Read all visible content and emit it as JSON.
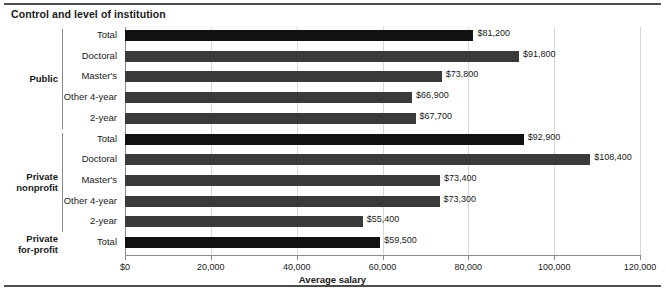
{
  "chart_data": {
    "type": "bar",
    "orientation": "horizontal",
    "title": "Control and level of institution",
    "xlabel": "Average salary",
    "ylabel": "",
    "xlim": [
      0,
      120000
    ],
    "grid": true,
    "legend": null,
    "xticks": [
      {
        "value": 0,
        "label": "$0"
      },
      {
        "value": 20000,
        "label": "20,000"
      },
      {
        "value": 40000,
        "label": "40,000"
      },
      {
        "value": 60000,
        "label": "60,000"
      },
      {
        "value": 80000,
        "label": "80,000"
      },
      {
        "value": 100000,
        "label": "100,000"
      },
      {
        "value": 120000,
        "label": "120,000"
      }
    ],
    "groups": [
      {
        "label": "Public",
        "label_lines": [
          "Public"
        ],
        "rows": [
          0,
          1,
          2,
          3,
          4
        ]
      },
      {
        "label": "Private nonprofit",
        "label_lines": [
          "Private",
          "nonprofit"
        ],
        "rows": [
          5,
          6,
          7,
          8,
          9
        ]
      },
      {
        "label": "Private for-profit",
        "label_lines": [
          "Private",
          "for-profit"
        ],
        "rows": [
          10
        ]
      }
    ],
    "categories": [
      "Total",
      "Doctoral",
      "Master's",
      "Other 4-year",
      "2-year",
      "Total",
      "Doctoral",
      "Master's",
      "Other 4-year",
      "2-year",
      "Total"
    ],
    "values": [
      81200,
      91800,
      73800,
      66900,
      67700,
      92900,
      108400,
      73400,
      73300,
      55400,
      59500
    ],
    "value_labels": [
      "$81,200",
      "$91,800",
      "$73,800",
      "$66,900",
      "$67,700",
      "$92,900",
      "$108,400",
      "$73,400",
      "$73,300",
      "$55,400",
      "$59,500"
    ],
    "emphasis": [
      true,
      false,
      false,
      false,
      false,
      true,
      false,
      false,
      false,
      false,
      true
    ],
    "colors": {
      "total_bar": "#111111",
      "detail_bar": "#3a3a3a",
      "gridline": "#d8d8d8",
      "axis": "#8a8a8a",
      "rule": "#4d4d4d",
      "text": "#1a1a1a",
      "background": "#ffffff"
    }
  }
}
